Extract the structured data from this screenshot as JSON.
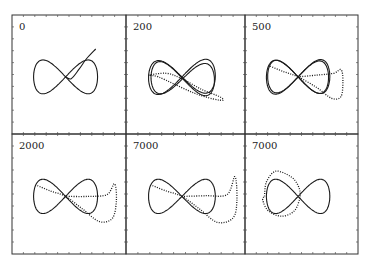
{
  "chart_data": {
    "type": "line",
    "title": "",
    "layout": "grid 2x3",
    "grid": false,
    "legend": "none",
    "panels": [
      {
        "label": "0",
        "series": [
          {
            "name": "figure-eight",
            "style": "solid",
            "shape": "lemniscate",
            "scale": 1.0,
            "cx": 0.0,
            "cy": 0.0,
            "skew": 0.0
          },
          {
            "name": "tail",
            "style": "solid",
            "shape": "tail",
            "points": [
              [
                0.0,
                0.0
              ],
              [
                0.15,
                -0.05
              ],
              [
                0.35,
                0.2
              ],
              [
                0.55,
                0.5
              ],
              [
                0.8,
                0.78
              ]
            ]
          }
        ]
      },
      {
        "label": "200",
        "series": [
          {
            "name": "orbit-a",
            "style": "solid",
            "shape": "lemniscate",
            "scale": 1.0,
            "cx": 0.0,
            "cy": 0.0,
            "skew": 0.1
          },
          {
            "name": "orbit-b",
            "style": "solid",
            "shape": "lemniscate",
            "scale": 0.95,
            "cx": 0.02,
            "cy": -0.05,
            "skew": -0.15
          },
          {
            "name": "transient",
            "style": "dotted",
            "shape": "tail",
            "points": [
              [
                -0.85,
                0.05
              ],
              [
                -0.4,
                0.1
              ],
              [
                0.0,
                -0.05
              ],
              [
                0.5,
                -0.35
              ],
              [
                0.95,
                -0.55
              ],
              [
                1.05,
                -0.65
              ],
              [
                0.8,
                -0.62
              ],
              [
                0.3,
                -0.45
              ],
              [
                -0.2,
                -0.2
              ],
              [
                -0.6,
                0.0
              ],
              [
                -0.85,
                0.05
              ]
            ]
          }
        ]
      },
      {
        "label": "500",
        "series": [
          {
            "name": "orbit-a",
            "style": "solid",
            "shape": "lemniscate",
            "scale": 1.0,
            "cx": 0.0,
            "cy": 0.0,
            "skew": 0.05
          },
          {
            "name": "orbit-b",
            "style": "solid",
            "shape": "lemniscate",
            "scale": 0.96,
            "cx": 0.0,
            "cy": 0.0,
            "skew": -0.05
          },
          {
            "name": "transient",
            "style": "dotted",
            "shape": "tail",
            "points": [
              [
                -0.75,
                0.3
              ],
              [
                -0.4,
                0.15
              ],
              [
                0.0,
                0.0
              ],
              [
                0.5,
                -0.3
              ],
              [
                0.9,
                -0.6
              ],
              [
                1.15,
                -0.55
              ],
              [
                1.2,
                -0.1
              ],
              [
                1.15,
                0.2
              ],
              [
                0.95,
                0.1
              ],
              [
                0.5,
                0.05
              ],
              [
                0.0,
                0.0
              ]
            ]
          }
        ]
      },
      {
        "label": "2000",
        "series": [
          {
            "name": "orbit",
            "style": "solid",
            "shape": "lemniscate",
            "scale": 1.0,
            "cx": 0.0,
            "cy": 0.0,
            "skew": 0.0
          },
          {
            "name": "transient",
            "style": "dotted",
            "shape": "tail",
            "points": [
              [
                -0.75,
                0.3
              ],
              [
                -0.4,
                0.15
              ],
              [
                0.0,
                0.0
              ],
              [
                0.45,
                -0.35
              ],
              [
                0.9,
                -0.7
              ],
              [
                1.25,
                -0.6
              ],
              [
                1.35,
                -0.1
              ],
              [
                1.3,
                0.35
              ],
              [
                1.1,
                0.05
              ],
              [
                0.6,
                0.0
              ],
              [
                0.0,
                0.0
              ]
            ]
          }
        ]
      },
      {
        "label": "7000",
        "series": [
          {
            "name": "orbit",
            "style": "solid",
            "shape": "lemniscate",
            "scale": 1.0,
            "cx": 0.0,
            "cy": 0.0,
            "skew": 0.0
          },
          {
            "name": "transient",
            "style": "dotted",
            "shape": "tail",
            "points": [
              [
                -0.75,
                0.3
              ],
              [
                -0.4,
                0.15
              ],
              [
                0.0,
                0.0
              ],
              [
                0.45,
                -0.35
              ],
              [
                0.9,
                -0.72
              ],
              [
                1.3,
                -0.6
              ],
              [
                1.4,
                -0.1
              ],
              [
                1.35,
                0.55
              ],
              [
                1.15,
                0.05
              ],
              [
                0.6,
                0.02
              ],
              [
                0.0,
                0.0
              ]
            ]
          }
        ]
      },
      {
        "label": "7000",
        "series": [
          {
            "name": "orbit",
            "style": "solid",
            "shape": "lemniscate",
            "scale": 1.0,
            "cx": 0.0,
            "cy": 0.0,
            "skew": 0.0
          },
          {
            "name": "transient",
            "style": "dotted",
            "shape": "tail",
            "points": [
              [
                -0.9,
                0.0
              ],
              [
                -0.85,
                0.4
              ],
              [
                -0.6,
                0.7
              ],
              [
                -0.2,
                0.55
              ],
              [
                0.0,
                0.3
              ],
              [
                0.05,
                0.0
              ],
              [
                -0.1,
                -0.4
              ],
              [
                -0.45,
                -0.55
              ],
              [
                -0.8,
                -0.4
              ],
              [
                -0.95,
                -0.1
              ],
              [
                -0.9,
                0.0
              ]
            ]
          }
        ]
      }
    ]
  }
}
